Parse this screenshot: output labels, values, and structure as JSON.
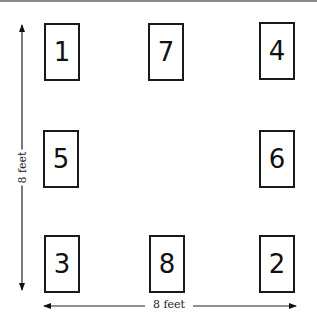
{
  "diagram": {
    "title": "",
    "desks": [
      {
        "label": "1",
        "row": "top",
        "col": "left"
      },
      {
        "label": "7",
        "row": "top",
        "col": "center"
      },
      {
        "label": "4",
        "row": "top",
        "col": "right"
      },
      {
        "label": "5",
        "row": "middle",
        "col": "left"
      },
      {
        "label": "6",
        "row": "middle",
        "col": "right"
      },
      {
        "label": "3",
        "row": "bottom",
        "col": "left"
      },
      {
        "label": "8",
        "row": "bottom",
        "col": "center"
      },
      {
        "label": "2",
        "row": "bottom",
        "col": "right"
      }
    ],
    "dimensions": {
      "vertical_label": "8 feet",
      "horizontal_label": "8 feet"
    }
  }
}
